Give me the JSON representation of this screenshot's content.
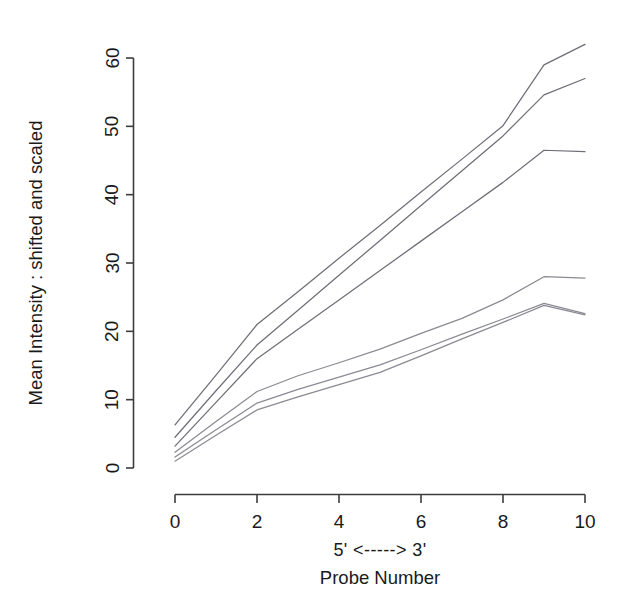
{
  "chart_data": {
    "type": "line",
    "title": "",
    "subtitle": "",
    "xlabel": "Probe Number",
    "xlabel_secondary": "5' <-----> 3'",
    "ylabel": "Mean Intensity : shifted and scaled",
    "xlim": [
      0,
      10
    ],
    "ylim": [
      0,
      62
    ],
    "grid": false,
    "legend": "none",
    "x": [
      0,
      1,
      2,
      3,
      4,
      5,
      6,
      7,
      8,
      9,
      10
    ],
    "x_ticks": [
      "0",
      "2",
      "4",
      "6",
      "8",
      "10"
    ],
    "x_tick_values": [
      0,
      2,
      4,
      6,
      8,
      10
    ],
    "y_ticks": [
      "0",
      "10",
      "20",
      "30",
      "40",
      "50",
      "60"
    ],
    "y_tick_values": [
      0,
      10,
      20,
      30,
      40,
      50,
      60
    ],
    "series": [
      {
        "name": "series-1",
        "color": "#6e6e78",
        "values": [
          6.3,
          13.6,
          21.0,
          25.8,
          30.7,
          35.5,
          40.4,
          45.2,
          50.1,
          59.0,
          62.0
        ]
      },
      {
        "name": "series-2",
        "color": "#6e6e78",
        "values": [
          4.5,
          11.3,
          18.0,
          23.1,
          28.2,
          33.3,
          38.4,
          43.5,
          48.6,
          54.6,
          57.0
        ]
      },
      {
        "name": "series-3",
        "color": "#6e6e78",
        "values": [
          3.2,
          9.6,
          16.0,
          20.3,
          24.6,
          28.9,
          33.2,
          37.5,
          41.8,
          46.5,
          46.3
        ]
      },
      {
        "name": "series-4",
        "color": "#8a8a93",
        "values": [
          2.3,
          6.8,
          11.2,
          13.5,
          15.4,
          17.4,
          19.7,
          21.9,
          24.6,
          28.0,
          27.8
        ]
      },
      {
        "name": "series-5",
        "color": "#8a8a93",
        "values": [
          1.6,
          5.6,
          9.5,
          11.5,
          13.3,
          15.1,
          17.3,
          19.6,
          21.8,
          24.1,
          22.6
        ]
      },
      {
        "name": "series-6",
        "color": "#8a8a93",
        "values": [
          1.0,
          4.8,
          8.5,
          10.4,
          12.2,
          14.0,
          16.4,
          18.9,
          21.3,
          23.8,
          22.4
        ]
      }
    ]
  },
  "axes": {
    "y_axis_label": "Mean Intensity : shifted and scaled",
    "x_axis_label": "Probe Number",
    "x_axis_direction_label": "5' <-----> 3'"
  }
}
